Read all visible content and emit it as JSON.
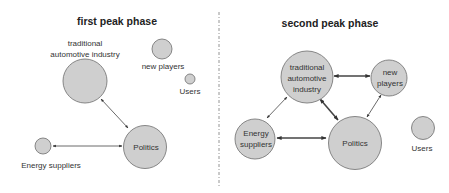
{
  "panels": [
    {
      "title": "first peak phase",
      "nodes": {
        "tai": {
          "label_lines": [
            "traditional",
            "automotive industry"
          ]
        },
        "new_players": {
          "label": "new players"
        },
        "users": {
          "label": "Users"
        },
        "politics": {
          "label": "Politics"
        },
        "energy": {
          "label": "Energy suppliers"
        }
      },
      "edges": [
        {
          "from": "tai",
          "to": "politics",
          "style": "thin",
          "direction": "bidirectional"
        },
        {
          "from": "energy",
          "to": "politics",
          "style": "thin",
          "direction": "bidirectional"
        }
      ]
    },
    {
      "title": "second peak phase",
      "nodes": {
        "tai": {
          "label_lines": [
            "traditional",
            "automotive",
            "industry"
          ]
        },
        "new_players": {
          "label_lines": [
            "new",
            "players"
          ]
        },
        "energy": {
          "label_lines": [
            "Energy",
            "suppliers"
          ]
        },
        "politics": {
          "label": "Politics"
        },
        "users": {
          "label": "Users"
        }
      },
      "edges": [
        {
          "from": "tai",
          "to": "new_players",
          "style": "thick",
          "direction": "bidirectional"
        },
        {
          "from": "tai",
          "to": "politics",
          "style": "thick",
          "direction": "bidirectional"
        },
        {
          "from": "tai",
          "to": "energy",
          "style": "thin",
          "direction": "bidirectional"
        },
        {
          "from": "energy",
          "to": "politics",
          "style": "thick",
          "direction": "bidirectional"
        },
        {
          "from": "new_players",
          "to": "politics",
          "style": "thin",
          "direction": "bidirectional"
        }
      ]
    }
  ],
  "colors": {
    "node_fill": "#cfcfcf",
    "node_stroke": "#7a7a7a",
    "edge": "#444444",
    "divider": "#888888"
  }
}
